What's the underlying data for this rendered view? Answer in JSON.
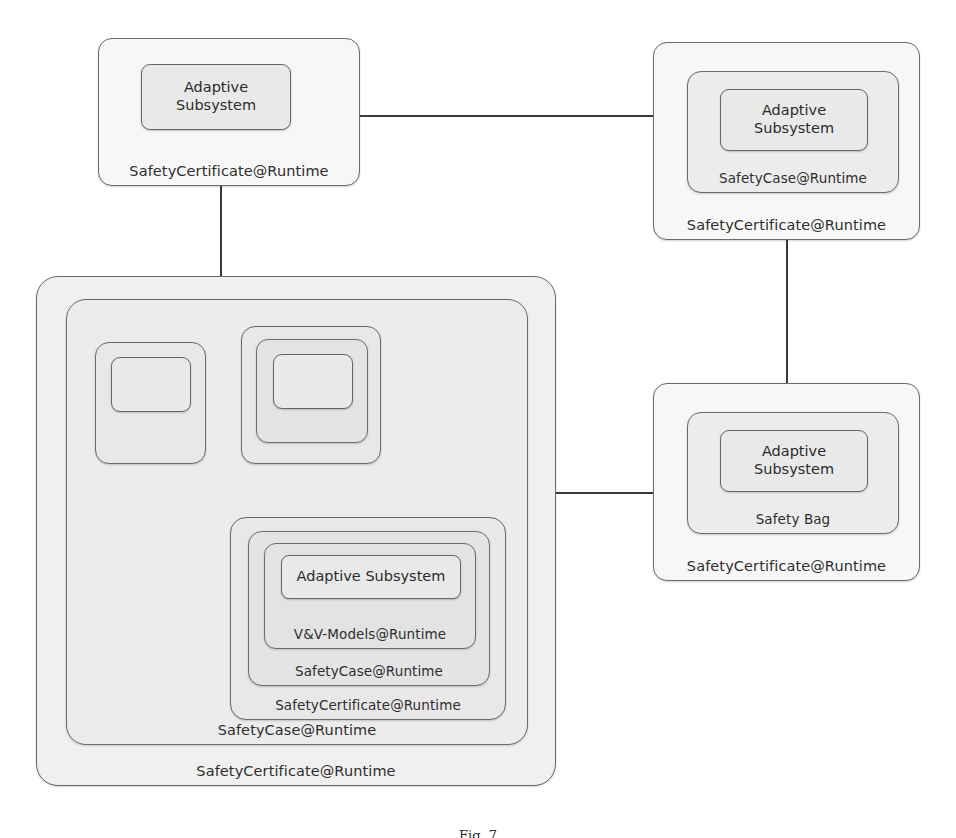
{
  "diagram": {
    "background_color": "#ffffff",
    "box_fill_color": "#ececec",
    "box_border_color": "#6b6b6b",
    "edge_color": "#3a3a3a",
    "text_color": "#2b2b2b"
  },
  "labels": {
    "adaptive_subsystem": "Adaptive\nSubsystem",
    "adaptive_subsystem_line1": "Adaptive",
    "adaptive_subsystem_line2": "Subsystem",
    "adaptive_subsystem_inline": "Adaptive Subsystem",
    "safety_certificate_runtime": "SafetyCertificate@Runtime",
    "safety_case_runtime": "SafetyCase@Runtime",
    "vv_models_runtime": "V&V-Models@Runtime",
    "safety_bag": "Safety Bag"
  },
  "nodes": {
    "top_left": {
      "id": "top-left-certificate",
      "outer_label": "SafetyCertificate@Runtime",
      "inner_label_line1": "Adaptive",
      "inner_label_line2": "Subsystem"
    },
    "top_right": {
      "id": "top-right-certificate",
      "outer_label": "SafetyCertificate@Runtime",
      "middle_label": "SafetyCase@Runtime",
      "inner_label_line1": "Adaptive",
      "inner_label_line2": "Subsystem"
    },
    "right_middle": {
      "id": "safety-bag-certificate",
      "outer_label": "SafetyCertificate@Runtime",
      "middle_label": "Safety Bag",
      "inner_label_line1": "Adaptive",
      "inner_label_line2": "Subsystem"
    },
    "composite": {
      "id": "composite-system",
      "outer_label": "SafetyCertificate@Runtime",
      "second_label": "SafetyCase@Runtime",
      "child_a": {
        "id": "child-a-empty",
        "label": ""
      },
      "child_b": {
        "id": "child-b-empty",
        "label": ""
      },
      "child_c": {
        "id": "child-c-certificate",
        "outer_label": "SafetyCertificate@Runtime",
        "second_label": "SafetyCase@Runtime",
        "third_label": "V&V-Models@Runtime",
        "inner_label": "Adaptive Subsystem"
      }
    }
  },
  "edges": [
    {
      "id": "edge-topleft-to-topright",
      "from": "top-left-certificate",
      "to": "top-right-certificate",
      "kind": "horizontal"
    },
    {
      "id": "edge-topleft-to-composite",
      "from": "top-left-certificate",
      "to": "composite-system",
      "kind": "vertical"
    },
    {
      "id": "edge-topright-to-safetybag",
      "from": "top-right-certificate",
      "to": "safety-bag-certificate",
      "kind": "vertical"
    },
    {
      "id": "edge-composite-to-safetybag",
      "from": "composite-system",
      "to": "safety-bag-certificate",
      "kind": "horizontal"
    },
    {
      "id": "edge-childa-to-childb",
      "from": "child-a-empty",
      "to": "child-b-empty",
      "kind": "horizontal"
    },
    {
      "id": "edge-childb-to-childc",
      "from": "child-b-empty",
      "to": "child-c-certificate",
      "kind": "vertical"
    },
    {
      "id": "edge-childa-to-childc",
      "from": "child-a-empty",
      "to": "child-c-certificate",
      "kind": "elbow"
    }
  ],
  "caption": {
    "text": "Fig. 7"
  }
}
